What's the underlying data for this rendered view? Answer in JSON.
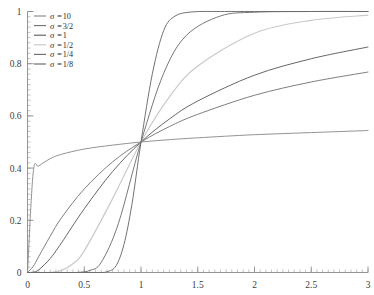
{
  "chart_data": {
    "type": "line",
    "title": "",
    "subtitle": "",
    "xlabel": "",
    "ylabel": "",
    "xlim": [
      0,
      3
    ],
    "ylim": [
      0,
      1
    ],
    "grid": false,
    "legend_position": "top-left",
    "x_ticks": [
      "0",
      "0.5",
      "1",
      "1.5",
      "2",
      "2.5",
      "3"
    ],
    "x_tick_values": [
      0,
      0.5,
      1,
      1.5,
      2,
      2.5,
      3
    ],
    "y_ticks": [
      "0",
      "0.2",
      "0.4",
      "0.6",
      "0.8",
      "1"
    ],
    "y_tick_values": [
      0,
      0.2,
      0.4,
      0.6,
      0.8,
      1
    ],
    "x_minor_step": 0.05,
    "y_minor_step": 0.02,
    "crossing_point": [
      1,
      0.5
    ],
    "series": [
      {
        "name": "σ =10",
        "sigma_label": "10",
        "sigma": 10,
        "color": "#8d8d8d",
        "width": 0.95,
        "x": [
          0.0,
          0.05,
          0.1,
          0.2,
          0.3,
          0.5,
          0.75,
          1.0,
          1.25,
          1.5,
          2.0,
          2.5,
          3.0
        ],
        "y": [
          0.0,
          0.382,
          0.408,
          0.436,
          0.453,
          0.473,
          0.488,
          0.5,
          0.509,
          0.516,
          0.528,
          0.536,
          0.544
        ]
      },
      {
        "name": "σ =3/2",
        "sigma_label": "3/2",
        "sigma": 1.5,
        "color": "#777777",
        "width": 0.95,
        "x": [
          0.0,
          0.05,
          0.1,
          0.2,
          0.3,
          0.5,
          0.75,
          1.0,
          1.25,
          1.5,
          2.0,
          2.5,
          3.0
        ],
        "y": [
          0.0,
          0.023,
          0.062,
          0.139,
          0.21,
          0.32,
          0.424,
          0.5,
          0.559,
          0.606,
          0.679,
          0.73,
          0.768
        ]
      },
      {
        "name": "σ =1",
        "sigma_label": "1",
        "sigma": 1,
        "color": "#5e5e5e",
        "width": 0.95,
        "x": [
          0.0,
          0.05,
          0.1,
          0.2,
          0.3,
          0.5,
          0.75,
          1.0,
          1.25,
          1.5,
          2.0,
          2.5,
          3.0
        ],
        "y": [
          0.0,
          0.0014,
          0.0105,
          0.0537,
          0.114,
          0.244,
          0.387,
          0.5,
          0.588,
          0.657,
          0.756,
          0.819,
          0.864
        ]
      },
      {
        "name": "σ =1/2",
        "sigma_label": "1/2",
        "sigma": 0.5,
        "color": "#c9c9c9",
        "width": 1.15,
        "x": [
          0.0,
          0.1,
          0.2,
          0.3,
          0.4,
          0.5,
          0.75,
          1.0,
          1.25,
          1.5,
          2.0,
          2.5,
          3.0
        ],
        "y": [
          0.0,
          0.0,
          0.0006,
          0.0082,
          0.0334,
          0.0828,
          0.283,
          0.5,
          0.673,
          0.791,
          0.917,
          0.966,
          0.986
        ]
      },
      {
        "name": "σ =1/4",
        "sigma_label": "1/4",
        "sigma": 0.25,
        "color": "#707070",
        "width": 0.95,
        "x": [
          0.0,
          0.2,
          0.35,
          0.45,
          0.55,
          0.65,
          0.8,
          1.0,
          1.2,
          1.4,
          1.7,
          2.0,
          2.5,
          3.0
        ],
        "y": [
          0.0,
          0.0,
          0.0,
          0.0007,
          0.0079,
          0.0391,
          0.1867,
          0.5,
          0.7634,
          0.9086,
          0.9828,
          0.9972,
          1.0,
          1.0
        ]
      },
      {
        "name": "σ =1/8",
        "sigma_label": "1/8",
        "sigma": 0.125,
        "color": "#6a6a6a",
        "width": 0.95,
        "x": [
          0.0,
          0.4,
          0.55,
          0.62,
          0.7,
          0.78,
          0.85,
          0.92,
          1.0,
          1.1,
          1.2,
          1.3,
          1.45,
          1.7,
          2.0,
          2.5,
          3.0
        ],
        "y": [
          0.0,
          0.0,
          0.0,
          0.0001,
          0.0026,
          0.0258,
          0.1078,
          0.2608,
          0.5,
          0.7614,
          0.927,
          0.9825,
          0.9984,
          1.0,
          1.0,
          1.0,
          1.0
        ]
      }
    ]
  },
  "legend": {
    "entries": [
      {
        "sigma_prefix": "σ =",
        "value": "10"
      },
      {
        "sigma_prefix": "σ =",
        "value": "3/2"
      },
      {
        "sigma_prefix": "σ =",
        "value": "1"
      },
      {
        "sigma_prefix": "σ =",
        "value": "1/2"
      },
      {
        "sigma_prefix": "σ =",
        "value": "1/4"
      },
      {
        "sigma_prefix": "σ =",
        "value": "1/8"
      }
    ]
  }
}
